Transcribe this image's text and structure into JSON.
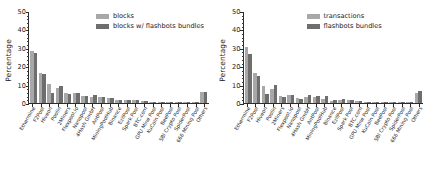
{
  "chart_data": [
    {
      "type": "bar",
      "title": "",
      "xlabel": "",
      "ylabel": "Percentage",
      "ylim": [
        0,
        50
      ],
      "yticks": [
        0,
        10,
        20,
        30,
        40,
        50
      ],
      "grid": false,
      "legend_position": "upper center",
      "categories": [
        "Ethermine",
        "F2Pool",
        "Hiveon",
        "Poolin",
        "2Miners",
        "Flexpool.io",
        "Nanopool",
        "4Hash GmbH",
        "AntPool",
        "MiningPoolHub",
        "Binance",
        "EzilPool",
        "Spark Pool",
        "BTC.com",
        "GPU Mine Pool",
        "KuCoin Pool",
        "BeePool",
        "SBI Crypto Pool",
        "SpiderPool",
        "666 Mining Pool",
        "Others"
      ],
      "series": [
        {
          "name": "blocks",
          "color": "#a8a8a8",
          "values": [
            28.0,
            16.2,
            10.3,
            8.3,
            5.2,
            5.4,
            3.8,
            3.3,
            3.1,
            2.7,
            1.4,
            1.5,
            1.7,
            1.2,
            0.7,
            0.6,
            0.6,
            0.5,
            0.5,
            0.4,
            5.8
          ]
        },
        {
          "name": "blocks w/ flashbots bundles",
          "color": "#6e6e6e",
          "values": [
            27.4,
            15.9,
            5.6,
            9.0,
            5.0,
            5.6,
            3.9,
            4.1,
            3.3,
            2.8,
            1.5,
            1.6,
            1.8,
            1.2,
            0.7,
            0.6,
            0.6,
            0.5,
            0.5,
            0.4,
            5.9
          ]
        }
      ]
    },
    {
      "type": "bar",
      "title": "",
      "xlabel": "",
      "ylabel": "Percentage",
      "ylim": [
        0,
        50
      ],
      "yticks": [
        0,
        10,
        20,
        30,
        40,
        50
      ],
      "grid": false,
      "legend_position": "upper center",
      "categories": [
        "Ethermine",
        "F2Pool",
        "Hiveon",
        "Poolin",
        "2Miners",
        "Flexpool.io",
        "Nanopool",
        "4Hash GmbH",
        "AntPool",
        "MiningPoolHub",
        "Binance",
        "EzilPool",
        "Spark Pool",
        "BTC.com",
        "GPU Mine Pool",
        "KuCoin Pool",
        "BeePool",
        "SBI Crypto Pool",
        "SpiderPool",
        "666 Mining Pool",
        "Others"
      ],
      "series": [
        {
          "name": "transactions",
          "color": "#a8a8a8",
          "values": [
            30.5,
            16.3,
            9.3,
            7.4,
            4.0,
            4.2,
            2.5,
            3.3,
            3.0,
            2.4,
            1.3,
            1.5,
            1.6,
            1.1,
            0.7,
            0.6,
            0.6,
            0.5,
            0.5,
            0.4,
            5.6
          ]
        },
        {
          "name": "flashbots bundles",
          "color": "#6e6e6e",
          "values": [
            26.4,
            14.8,
            5.0,
            10.0,
            3.4,
            4.5,
            2.4,
            4.4,
            4.0,
            4.0,
            1.8,
            2.4,
            1.8,
            1.0,
            0.6,
            0.6,
            0.6,
            0.5,
            0.5,
            0.4,
            6.6
          ]
        }
      ]
    }
  ]
}
